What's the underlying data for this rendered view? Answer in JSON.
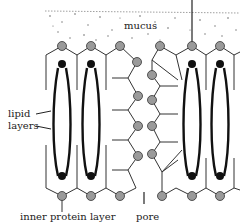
{
  "diagram": {
    "labels": {
      "mucus": "mucus",
      "lipid": "lipid",
      "layers": "layers",
      "inner_protein_layer": "inner protein layer",
      "pore": "pore"
    },
    "colors": {
      "line": "#333333",
      "protein_fill": "#9a9a9a",
      "lipid_head": "#111111",
      "mucus_dots": "#555555"
    },
    "components": [
      "mucus layer",
      "outer protein layer",
      "lipid bilayer",
      "inner protein layer",
      "pore channel"
    ]
  }
}
